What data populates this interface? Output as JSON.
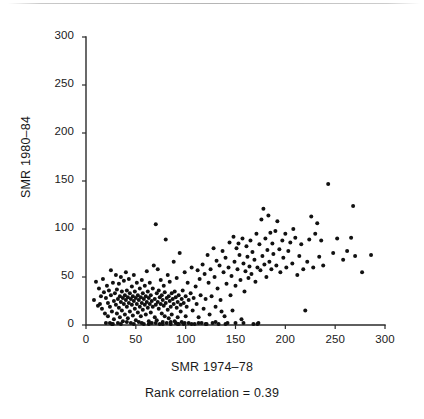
{
  "figure": {
    "background_color": "#ffffff",
    "ink_color": "#111111",
    "axis_color": "#2b2b2b"
  },
  "caption": {
    "text": "Rank correlation = 0.39"
  },
  "chart_data": {
    "type": "scatter",
    "title": "",
    "subtitle": "",
    "xlabel": "SMR 1974–78",
    "ylabel": "SMR 1980–84",
    "annotation": "Rank correlation = 0.39",
    "rank_correlation": 0.39,
    "xlim": [
      0,
      300
    ],
    "ylim": [
      0,
      300
    ],
    "xticks": [
      0,
      50,
      100,
      150,
      200,
      250,
      300
    ],
    "yticks": [
      0,
      50,
      100,
      150,
      200,
      250,
      300
    ],
    "xticklabels": [
      "0",
      "50",
      "100",
      "150",
      "200",
      "250",
      "300"
    ],
    "yticklabels": [
      "0",
      "50",
      "100",
      "150",
      "200",
      "250",
      "300"
    ],
    "grid": false,
    "legend": null,
    "marker": "dot",
    "marker_size": 2.0,
    "marker_color": "#111111",
    "n_points": 305,
    "points": [
      [
        8,
        26
      ],
      [
        10,
        45
      ],
      [
        12,
        20
      ],
      [
        13,
        38
      ],
      [
        14,
        22
      ],
      [
        15,
        30
      ],
      [
        16,
        17
      ],
      [
        17,
        48
      ],
      [
        18,
        34
      ],
      [
        19,
        12
      ],
      [
        20,
        28
      ],
      [
        20,
        2
      ],
      [
        21,
        41
      ],
      [
        22,
        23
      ],
      [
        22,
        9
      ],
      [
        23,
        36
      ],
      [
        24,
        19
      ],
      [
        25,
        57
      ],
      [
        25,
        31
      ],
      [
        26,
        14
      ],
      [
        26,
        1
      ],
      [
        27,
        44
      ],
      [
        28,
        25
      ],
      [
        28,
        6
      ],
      [
        29,
        33
      ],
      [
        30,
        21
      ],
      [
        30,
        52
      ],
      [
        31,
        12
      ],
      [
        31,
        37
      ],
      [
        32,
        27
      ],
      [
        32,
        2
      ],
      [
        33,
        43
      ],
      [
        33,
        18
      ],
      [
        34,
        30
      ],
      [
        34,
        8
      ],
      [
        35,
        24
      ],
      [
        35,
        50
      ],
      [
        36,
        15
      ],
      [
        36,
        35
      ],
      [
        37,
        28
      ],
      [
        37,
        4
      ],
      [
        38,
        22
      ],
      [
        38,
        46
      ],
      [
        39,
        31
      ],
      [
        39,
        11
      ],
      [
        40,
        26
      ],
      [
        40,
        55
      ],
      [
        41,
        19
      ],
      [
        41,
        36
      ],
      [
        42,
        29
      ],
      [
        42,
        7
      ],
      [
        43,
        23
      ],
      [
        43,
        48
      ],
      [
        44,
        33
      ],
      [
        44,
        14
      ],
      [
        45,
        27
      ],
      [
        45,
        2
      ],
      [
        46,
        21
      ],
      [
        46,
        40
      ],
      [
        47,
        30
      ],
      [
        47,
        10
      ],
      [
        48,
        25
      ],
      [
        48,
        52
      ],
      [
        49,
        17
      ],
      [
        49,
        35
      ],
      [
        50,
        28
      ],
      [
        50,
        5
      ],
      [
        51,
        22
      ],
      [
        51,
        44
      ],
      [
        52,
        31
      ],
      [
        52,
        13
      ],
      [
        53,
        26
      ],
      [
        53,
        3
      ],
      [
        54,
        19
      ],
      [
        54,
        38
      ],
      [
        55,
        29
      ],
      [
        55,
        9
      ],
      [
        56,
        23
      ],
      [
        56,
        47
      ],
      [
        57,
        16
      ],
      [
        57,
        33
      ],
      [
        58,
        27
      ],
      [
        58,
        1
      ],
      [
        59,
        21
      ],
      [
        59,
        41
      ],
      [
        60,
        30
      ],
      [
        60,
        11
      ],
      [
        61,
        24
      ],
      [
        61,
        56
      ],
      [
        62,
        18
      ],
      [
        62,
        35
      ],
      [
        63,
        28
      ],
      [
        63,
        4
      ],
      [
        64,
        22
      ],
      [
        64,
        44
      ],
      [
        65,
        31
      ],
      [
        65,
        13
      ],
      [
        66,
        25
      ],
      [
        66,
        2
      ],
      [
        67,
        19
      ],
      [
        67,
        38
      ],
      [
        68,
        62
      ],
      [
        69,
        27
      ],
      [
        69,
        8
      ],
      [
        70,
        105
      ],
      [
        70,
        21
      ],
      [
        71,
        33
      ],
      [
        71,
        5
      ],
      [
        72,
        24
      ],
      [
        72,
        58
      ],
      [
        73,
        17
      ],
      [
        73,
        36
      ],
      [
        74,
        29
      ],
      [
        74,
        1
      ],
      [
        75,
        22
      ],
      [
        75,
        47
      ],
      [
        76,
        31
      ],
      [
        76,
        12
      ],
      [
        77,
        26
      ],
      [
        77,
        3
      ],
      [
        78,
        20
      ],
      [
        78,
        41
      ],
      [
        79,
        34
      ],
      [
        79,
        9
      ],
      [
        80,
        23
      ],
      [
        80,
        89
      ],
      [
        81,
        28
      ],
      [
        81,
        2
      ],
      [
        82,
        16
      ],
      [
        82,
        52
      ],
      [
        83,
        30
      ],
      [
        83,
        7
      ],
      [
        84,
        25
      ],
      [
        84,
        45
      ],
      [
        85,
        19
      ],
      [
        85,
        1
      ],
      [
        86,
        33
      ],
      [
        86,
        11
      ],
      [
        87,
        27
      ],
      [
        88,
        22
      ],
      [
        88,
        66
      ],
      [
        89,
        35
      ],
      [
        89,
        4
      ],
      [
        90,
        29
      ],
      [
        90,
        2
      ],
      [
        91,
        18
      ],
      [
        91,
        49
      ],
      [
        92,
        24
      ],
      [
        92,
        8
      ],
      [
        93,
        31
      ],
      [
        93,
        1
      ],
      [
        94,
        75
      ],
      [
        95,
        21
      ],
      [
        95,
        14
      ],
      [
        96,
        27
      ],
      [
        96,
        3
      ],
      [
        97,
        36
      ],
      [
        98,
        23
      ],
      [
        98,
        1
      ],
      [
        99,
        55
      ],
      [
        100,
        30
      ],
      [
        100,
        9
      ],
      [
        101,
        19
      ],
      [
        102,
        44
      ],
      [
        103,
        26
      ],
      [
        103,
        2
      ],
      [
        105,
        33
      ],
      [
        106,
        60
      ],
      [
        107,
        15
      ],
      [
        108,
        28
      ],
      [
        109,
        1
      ],
      [
        110,
        40
      ],
      [
        111,
        22
      ],
      [
        112,
        57
      ],
      [
        113,
        8
      ],
      [
        114,
        48
      ],
      [
        115,
        31
      ],
      [
        116,
        2
      ],
      [
        117,
        63
      ],
      [
        118,
        17
      ],
      [
        119,
        53
      ],
      [
        120,
        27
      ],
      [
        121,
        1
      ],
      [
        122,
        73
      ],
      [
        123,
        44
      ],
      [
        124,
        11
      ],
      [
        125,
        58
      ],
      [
        126,
        30
      ],
      [
        127,
        2
      ],
      [
        128,
        80
      ],
      [
        129,
        50
      ],
      [
        130,
        19
      ],
      [
        131,
        67
      ],
      [
        132,
        38
      ],
      [
        133,
        1
      ],
      [
        134,
        62
      ],
      [
        135,
        26
      ],
      [
        136,
        14
      ],
      [
        137,
        77
      ],
      [
        138,
        55
      ],
      [
        139,
        9
      ],
      [
        140,
        70
      ],
      [
        141,
        43
      ],
      [
        142,
        2
      ],
      [
        143,
        60
      ],
      [
        144,
        86
      ],
      [
        145,
        31
      ],
      [
        146,
        51
      ],
      [
        147,
        15
      ],
      [
        148,
        92
      ],
      [
        149,
        66
      ],
      [
        150,
        41
      ],
      [
        151,
        80
      ],
      [
        152,
        58
      ],
      [
        153,
        85
      ],
      [
        154,
        73
      ],
      [
        155,
        47
      ],
      [
        156,
        6
      ],
      [
        157,
        90
      ],
      [
        158,
        64
      ],
      [
        159,
        35
      ],
      [
        160,
        56
      ],
      [
        161,
        82
      ],
      [
        162,
        71
      ],
      [
        163,
        49
      ],
      [
        164,
        61
      ],
      [
        165,
        88
      ],
      [
        166,
        53
      ],
      [
        167,
        76
      ],
      [
        168,
        1
      ],
      [
        169,
        68
      ],
      [
        170,
        45
      ],
      [
        171,
        95
      ],
      [
        172,
        60
      ],
      [
        173,
        2
      ],
      [
        174,
        84
      ],
      [
        175,
        57
      ],
      [
        176,
        110
      ],
      [
        177,
        72
      ],
      [
        178,
        121
      ],
      [
        179,
        63
      ],
      [
        180,
        90
      ],
      [
        181,
        50
      ],
      [
        182,
        78
      ],
      [
        183,
        114
      ],
      [
        184,
        66
      ],
      [
        185,
        96
      ],
      [
        186,
        58
      ],
      [
        187,
        85
      ],
      [
        188,
        74
      ],
      [
        190,
        98
      ],
      [
        191,
        62
      ],
      [
        192,
        108
      ],
      [
        194,
        79
      ],
      [
        195,
        55
      ],
      [
        197,
        88
      ],
      [
        198,
        70
      ],
      [
        200,
        95
      ],
      [
        201,
        60
      ],
      [
        203,
        77
      ],
      [
        205,
        86
      ],
      [
        207,
        64
      ],
      [
        208,
        100
      ],
      [
        210,
        91
      ],
      [
        212,
        52
      ],
      [
        214,
        72
      ],
      [
        216,
        84
      ],
      [
        218,
        58
      ],
      [
        220,
        15
      ],
      [
        222,
        66
      ],
      [
        224,
        89
      ],
      [
        226,
        113
      ],
      [
        228,
        60
      ],
      [
        230,
        95
      ],
      [
        232,
        106
      ],
      [
        234,
        71
      ],
      [
        236,
        88
      ],
      [
        238,
        62
      ],
      [
        243,
        147
      ],
      [
        248,
        75
      ],
      [
        252,
        90
      ],
      [
        258,
        68
      ],
      [
        262,
        77
      ],
      [
        266,
        91
      ],
      [
        268,
        124
      ],
      [
        270,
        72
      ],
      [
        277,
        55
      ],
      [
        286,
        73
      ],
      [
        24,
        2
      ],
      [
        27,
        1
      ],
      [
        35,
        1
      ],
      [
        41,
        3
      ],
      [
        48,
        1
      ],
      [
        56,
        2
      ],
      [
        63,
        1
      ],
      [
        70,
        2
      ],
      [
        77,
        1
      ],
      [
        85,
        3
      ],
      [
        92,
        1
      ],
      [
        99,
        2
      ],
      [
        106,
        1
      ],
      [
        113,
        2
      ],
      [
        120,
        1
      ],
      [
        130,
        3
      ],
      [
        140,
        1
      ],
      [
        150,
        2
      ],
      [
        158,
        2
      ],
      [
        172,
        1
      ]
    ]
  }
}
